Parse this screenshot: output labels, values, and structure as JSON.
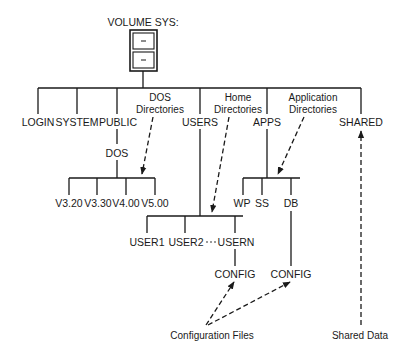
{
  "diagram": {
    "title": "VOLUME SYS:",
    "root_icon": "file-cabinet-icon",
    "colors": {
      "line": "#1a1a1a",
      "background": "#ffffff"
    },
    "root_children": [
      {
        "label": "LOGIN"
      },
      {
        "label": "SYSTEM"
      },
      {
        "label": "PUBLIC"
      },
      {
        "label": "USERS"
      },
      {
        "label": "APPS"
      },
      {
        "label": "SHARED"
      }
    ],
    "public": {
      "child": "DOS",
      "dos_children": [
        "V3.20",
        "V3.30",
        "V4.00",
        "V5.00"
      ]
    },
    "users": {
      "children": [
        "USER1",
        "USER2",
        "USERN"
      ],
      "ellipsis": "· · ·",
      "usern_child": "CONFIG"
    },
    "apps": {
      "children": [
        "WP",
        "SS",
        "DB"
      ],
      "db_child": "CONFIG"
    },
    "annotations": {
      "dos_directories": [
        "DOS",
        "Directories"
      ],
      "home_directories": [
        "Home",
        "Directories"
      ],
      "application_directories": [
        "Application",
        "Directories"
      ],
      "configuration_files": "Configuration Files",
      "shared_data": "Shared Data"
    }
  }
}
